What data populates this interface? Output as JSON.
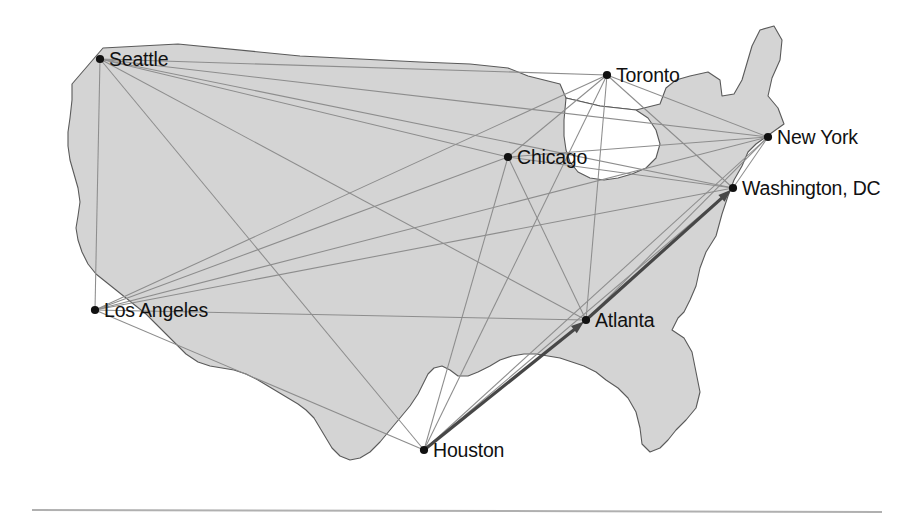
{
  "figure": {
    "name": "airline-route-network-map",
    "region_title": "United States",
    "background_color": "#ffffff",
    "land_fill_color": "#d4d4d4",
    "land_stroke_color": "#5a5a5a",
    "lake_fill_color": "#ffffff",
    "route_color": "#8d8d8d",
    "highlight_color": "#474747",
    "dot_color": "#111111",
    "label_color": "#111111",
    "divider_color": "#b0b0b0"
  },
  "cities": [
    {
      "id": "seattle",
      "label": "Seattle",
      "x": 100,
      "y": 59,
      "label_dx": 9,
      "label_dy": 7,
      "anchor": "start"
    },
    {
      "id": "toronto",
      "label": "Toronto",
      "x": 607,
      "y": 75,
      "label_dx": 9,
      "label_dy": 7,
      "anchor": "start"
    },
    {
      "id": "new-york",
      "label": "New York",
      "x": 768,
      "y": 137,
      "label_dx": 9,
      "label_dy": 7,
      "anchor": "start"
    },
    {
      "id": "washington",
      "label": "Washington, DC",
      "x": 733,
      "y": 188,
      "label_dx": 9,
      "label_dy": 7,
      "anchor": "start"
    },
    {
      "id": "chicago",
      "label": "Chicago",
      "x": 508,
      "y": 157,
      "label_dx": 9,
      "label_dy": 7,
      "anchor": "start"
    },
    {
      "id": "los-angeles",
      "label": "Los Angeles",
      "x": 95,
      "y": 310,
      "label_dx": 9,
      "label_dy": 7,
      "anchor": "start"
    },
    {
      "id": "atlanta",
      "label": "Atlanta",
      "x": 586,
      "y": 320,
      "label_dx": 9,
      "label_dy": 7,
      "anchor": "start"
    },
    {
      "id": "houston",
      "label": "Houston",
      "x": 424,
      "y": 450,
      "label_dx": 9,
      "label_dy": 7,
      "anchor": "start"
    }
  ],
  "routes": [
    {
      "from": "seattle",
      "to": "toronto"
    },
    {
      "from": "seattle",
      "to": "new-york"
    },
    {
      "from": "seattle",
      "to": "washington"
    },
    {
      "from": "seattle",
      "to": "chicago"
    },
    {
      "from": "seattle",
      "to": "atlanta"
    },
    {
      "from": "seattle",
      "to": "houston"
    },
    {
      "from": "seattle",
      "to": "los-angeles"
    },
    {
      "from": "los-angeles",
      "to": "toronto"
    },
    {
      "from": "los-angeles",
      "to": "new-york"
    },
    {
      "from": "los-angeles",
      "to": "washington"
    },
    {
      "from": "los-angeles",
      "to": "chicago"
    },
    {
      "from": "los-angeles",
      "to": "atlanta"
    },
    {
      "from": "los-angeles",
      "to": "houston"
    },
    {
      "from": "chicago",
      "to": "toronto"
    },
    {
      "from": "chicago",
      "to": "new-york"
    },
    {
      "from": "chicago",
      "to": "washington"
    },
    {
      "from": "chicago",
      "to": "atlanta"
    },
    {
      "from": "chicago",
      "to": "houston"
    },
    {
      "from": "toronto",
      "to": "new-york"
    },
    {
      "from": "toronto",
      "to": "washington"
    },
    {
      "from": "toronto",
      "to": "atlanta"
    },
    {
      "from": "toronto",
      "to": "houston"
    },
    {
      "from": "atlanta",
      "to": "new-york"
    },
    {
      "from": "atlanta",
      "to": "washington"
    },
    {
      "from": "atlanta",
      "to": "houston"
    },
    {
      "from": "houston",
      "to": "new-york"
    },
    {
      "from": "houston",
      "to": "washington"
    },
    {
      "from": "new-york",
      "to": "washington"
    }
  ],
  "highlighted_path": {
    "name": "houston-atlanta-washington-route",
    "stops": [
      "houston",
      "atlanta",
      "washington"
    ],
    "arrow_targets": [
      "atlanta",
      "washington"
    ]
  },
  "geometry": {
    "land_path": "M 72 84 L 103 48 L 178 44 L 300 56 L 420 62 L 470 64 L 508 68 L 528 76 L 560 84 L 566 98 L 600 106 L 636 110 L 660 104 L 666 88 L 676 80 L 690 76 L 708 72 L 720 80 L 722 96 L 734 94 L 742 80 L 752 46 L 760 30 L 774 26 L 782 40 L 780 60 L 772 78 L 768 96 L 778 108 L 784 124 L 770 134 L 756 144 L 748 152 L 742 166 L 734 180 L 728 196 L 722 214 L 716 236 L 706 252 L 700 268 L 696 286 L 690 300 L 684 312 L 678 318 L 672 330 L 684 338 L 692 352 L 696 372 L 700 392 L 696 408 L 686 420 L 676 430 L 668 440 L 660 448 L 650 452 L 642 444 L 640 428 L 636 412 L 628 398 L 618 388 L 606 380 L 596 372 L 584 366 L 572 362 L 560 358 L 548 356 L 536 354 L 524 354 L 512 356 L 500 360 L 490 366 L 478 372 L 468 376 L 458 376 L 450 370 L 442 366 L 434 368 L 428 374 L 424 382 L 418 394 L 410 406 L 400 418 L 390 430 L 380 442 L 370 452 L 360 458 L 350 460 L 340 456 L 332 448 L 326 438 L 320 428 L 314 418 L 306 410 L 298 404 L 288 398 L 278 392 L 268 386 L 258 380 L 246 374 L 234 370 L 222 368 L 210 366 L 198 362 L 186 354 L 176 344 L 166 334 L 156 324 L 146 314 L 136 306 L 126 298 L 116 290 L 106 282 L 96 274 L 88 264 L 82 252 L 78 240 L 76 228 L 78 216 L 80 202 L 78 188 L 74 174 L 70 160 L 68 146 L 68 132 L 70 118 L 72 100 Z",
    "lake_path": "M 566 98 L 600 106 L 636 110 L 648 118 L 656 130 L 660 144 L 656 158 L 646 168 L 632 174 L 618 178 L 604 180 L 590 178 L 578 172 L 570 162 L 566 150 L 564 136 L 564 120 Z",
    "divider_y": 510,
    "divider_x1": 32,
    "divider_x2": 882
  }
}
